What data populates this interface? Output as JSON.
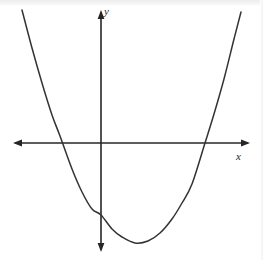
{
  "figure": {
    "kind": "coordinate-plane-parabola",
    "width": 263,
    "height": 260,
    "background_color": "#ffffff",
    "stroke_color": "#333333",
    "axis_color": "#262626"
  },
  "axes": {
    "x": {
      "label": "x",
      "arrowheads": "both",
      "pixel_start_x": 13,
      "pixel_end_x": 250,
      "pixel_y": 143
    },
    "y": {
      "label": "y",
      "arrowheads": "both",
      "pixel_x": 101,
      "pixel_start_y": 10,
      "pixel_end_y": 252
    },
    "origin": {
      "x": 101,
      "y": 143
    }
  },
  "chart_data": {
    "type": "line",
    "title": "",
    "subtitle": "",
    "xlabel": "x",
    "ylabel": "y",
    "grid": false,
    "legend": null,
    "curve_kind": "parabola",
    "opens": "up",
    "vertex_px": {
      "x": 135,
      "y": 243
    },
    "x_intercepts_px": [
      60,
      205
    ],
    "y_intercept_px": 215,
    "xlim_px": [
      22,
      241
    ],
    "ylim_px": [
      10,
      248
    ],
    "x": [
      22,
      32,
      42,
      52,
      60,
      72,
      82,
      92,
      101,
      112,
      122,
      135,
      148,
      160,
      172,
      182,
      192,
      205,
      214,
      224,
      234,
      241
    ],
    "y": [
      10,
      48,
      83,
      115,
      136,
      169,
      192,
      209,
      215,
      229,
      237,
      243,
      241,
      233,
      219,
      203,
      184,
      143,
      114,
      79,
      39,
      12
    ],
    "annotations": []
  }
}
